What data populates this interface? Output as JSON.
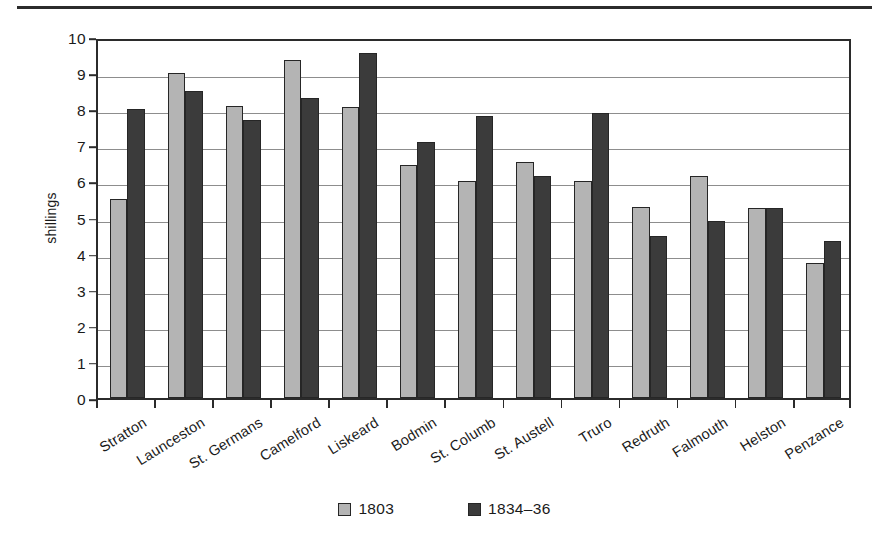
{
  "figure": {
    "y_axis_title": "shillings",
    "y_ticks": [
      "0",
      "1",
      "2",
      "3",
      "4",
      "5",
      "6",
      "7",
      "8",
      "9",
      "10"
    ]
  },
  "legend": {
    "entries": [
      {
        "label": "1803",
        "color": "#b4b4b4",
        "swatch": "legend-swatch-1803"
      },
      {
        "label": "1834–36",
        "color": "#3b3b3b",
        "swatch": "legend-swatch-1834-36"
      }
    ]
  },
  "chart_data": {
    "type": "bar",
    "title": "",
    "xlabel": "",
    "ylabel": "shillings",
    "ylim": [
      0,
      10
    ],
    "ytick_step": 1,
    "grid": true,
    "legend_position": "bottom-center",
    "categories": [
      "Stratton",
      "Launceston",
      "St. Germans",
      "Camelford",
      "Liskeard",
      "Bodmin",
      "St. Columb",
      "St. Austell",
      "Truro",
      "Redruth",
      "Falmouth",
      "Helston",
      "Penzance"
    ],
    "series": [
      {
        "name": "1803",
        "color": "#b4b4b4",
        "values": [
          5.5,
          9.0,
          8.1,
          9.35,
          8.05,
          6.45,
          6.0,
          6.55,
          6.0,
          5.3,
          6.15,
          5.25,
          3.75
        ]
      },
      {
        "name": "1834–36",
        "color": "#3b3b3b",
        "values": [
          8.0,
          8.5,
          7.7,
          8.3,
          9.55,
          7.1,
          7.8,
          6.15,
          7.9,
          4.5,
          4.9,
          5.25,
          4.35
        ]
      }
    ]
  }
}
